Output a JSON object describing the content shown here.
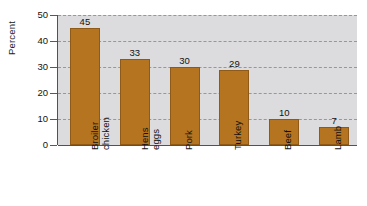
{
  "chart_data": {
    "type": "bar",
    "title": "",
    "subtitle": "",
    "xlabel": "",
    "ylabel": "Percent",
    "categories": [
      "Broiler chicken",
      "Hens eggs",
      "Pork",
      "Turkey",
      "Beef",
      "Lamb"
    ],
    "category_lines": [
      [
        "Broiler",
        "chicken"
      ],
      [
        "Hens",
        "eggs"
      ],
      [
        "Pork"
      ],
      [
        "Turkey"
      ],
      [
        "Beef"
      ],
      [
        "Lamb"
      ]
    ],
    "values": [
      45,
      33,
      30,
      29,
      10,
      7
    ],
    "value_labels": [
      "45",
      "33",
      "30",
      "29",
      "10",
      "7"
    ],
    "ylim": [
      0,
      50
    ],
    "ytick_values": [
      0,
      10,
      20,
      30,
      40,
      50
    ],
    "ytick_labels": [
      "0",
      "10",
      "20",
      "30",
      "40",
      "50"
    ],
    "grid": true,
    "grid_style": "dashed",
    "legend": "none",
    "bar_color": "#b5741f",
    "bar_edge_color": "#8f5a17",
    "plot_background": "#dcdcde",
    "gridline_color": "#8f98a3",
    "axis_color": "#4e535a",
    "text_color": "#121212",
    "figure_background": "#ffffff"
  }
}
